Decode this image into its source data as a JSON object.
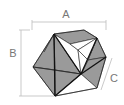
{
  "diagram": {
    "labels": {
      "a": "A",
      "b": "B",
      "c": "C"
    },
    "colors": {
      "face_shaded": "#9a9a9a",
      "face_light": "#ffffff",
      "edge": "#222222",
      "dimension_line": "#bbbbbb",
      "label": "#777777"
    }
  }
}
